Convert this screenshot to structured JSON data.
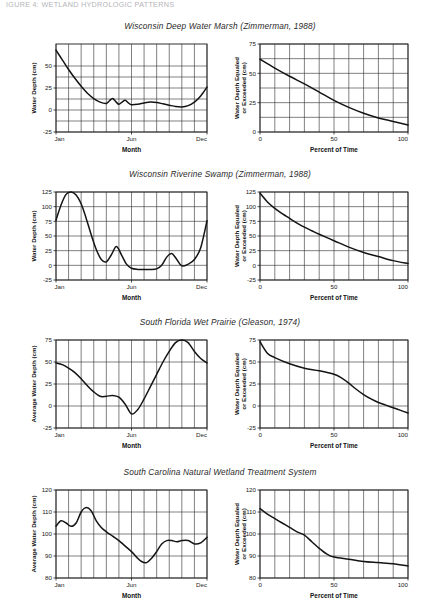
{
  "page": {
    "header_text": "IGURE 4: WETLAND HYDROLOGIC PATTERNS"
  },
  "rows": [
    {
      "title": "Wisconsin Deep Water Marsh (Zimmerman, 1988)",
      "left": {
        "ylabel": "Water Depth (cm)",
        "xlabel": "Month",
        "yticks": [
          "-25",
          "0",
          "25",
          "50"
        ],
        "xticks": [
          "Jan",
          "Jun",
          "Dec"
        ]
      },
      "right": {
        "ylabel_line1": "Water Depth Equaled",
        "ylabel_line2": "or Exceeded (cm)",
        "xlabel": "Percent of Time",
        "yticks": [
          "0",
          "25",
          "50",
          "75"
        ],
        "xticks": [
          "0",
          "50",
          "100"
        ]
      }
    },
    {
      "title": "Wisconsin Riverine Swamp (Zimmerman, 1988)",
      "left": {
        "ylabel": "Water Depth (cm)",
        "xlabel": "Month",
        "yticks": [
          "-25",
          "0",
          "25",
          "50",
          "75",
          "100",
          "125"
        ],
        "xticks": [
          "Jan",
          "Jun",
          "Dec"
        ]
      },
      "right": {
        "ylabel_line1": "Water Depth Equaled",
        "ylabel_line2": "or Exceeded (cm)",
        "xlabel": "Percent of Time",
        "yticks": [
          "-25",
          "0",
          "25",
          "50",
          "75",
          "100",
          "125"
        ],
        "xticks": [
          "0",
          "50",
          "100"
        ]
      }
    },
    {
      "title": "South Florida Wet Prairie (Gleason, 1974)",
      "left": {
        "ylabel": "Average Water Depth (cm)",
        "xlabel": "Month",
        "yticks": [
          "-25",
          "0",
          "25",
          "50",
          "75"
        ],
        "xticks": [
          "Jan",
          "Jun",
          "Dec"
        ]
      },
      "right": {
        "ylabel_line1": "Water Depth Equaled",
        "ylabel_line2": "or Exceeded (cm)",
        "xlabel": "Percent of Time",
        "yticks": [
          "-25",
          "0",
          "25",
          "50",
          "75"
        ],
        "xticks": [
          "0",
          "50",
          "100"
        ]
      }
    },
    {
      "title": "South Carolina Natural Wetland Treatment System",
      "left": {
        "ylabel": "Average Water Depth (cm)",
        "xlabel": "Month",
        "yticks": [
          "80",
          "90",
          "100",
          "110",
          "120"
        ],
        "xticks": [
          "Jan",
          "Jun",
          "Dec"
        ]
      },
      "right": {
        "ylabel_line1": "Water Depth Equaled",
        "ylabel_line2": "or Exceeded (cm)",
        "xlabel": "Percent of Time",
        "yticks": [
          "80",
          "90",
          "100",
          "110",
          "120"
        ],
        "xticks": [
          "0",
          "50",
          "100"
        ]
      }
    }
  ],
  "chart_data": [
    {
      "type": "line",
      "title": "Wisconsin Deep Water Marsh (Zimmerman, 1988) - Hydrograph",
      "xlabel": "Month",
      "ylabel": "Water Depth (cm)",
      "xlim": [
        0,
        12
      ],
      "ylim": [
        -25,
        75
      ],
      "ytick_values": [
        -25,
        0,
        25,
        50
      ],
      "xtick_values": [
        0,
        6,
        12
      ],
      "xtick_labels": [
        "Jan",
        "Jun",
        "Dec"
      ],
      "grid": true,
      "x": [
        0,
        0.5,
        1,
        1.5,
        2,
        2.5,
        3,
        3.5,
        4,
        4.25,
        4.5,
        4.75,
        5,
        5.25,
        5.5,
        5.75,
        6,
        6.5,
        7,
        7.5,
        8,
        8.5,
        9,
        9.5,
        10,
        10.5,
        11,
        11.5,
        12
      ],
      "y": [
        68,
        57,
        46,
        36,
        27,
        19,
        13,
        9,
        7.5,
        10.5,
        13,
        9.5,
        6.5,
        9,
        11,
        8,
        6,
        6.5,
        8,
        9,
        8.5,
        7,
        5.5,
        4,
        3.5,
        5,
        9,
        16,
        26
      ]
    },
    {
      "type": "line",
      "title": "Wisconsin Deep Water Marsh (Zimmerman, 1988) - Duration Curve",
      "xlabel": "Percent of Time",
      "ylabel": "Water Depth Equaled or Exceeded (cm)",
      "xlim": [
        0,
        100
      ],
      "ylim": [
        0,
        75
      ],
      "ytick_values": [
        0,
        25,
        50,
        75
      ],
      "xtick_values": [
        0,
        50,
        100
      ],
      "grid": true,
      "x": [
        0,
        10,
        20,
        30,
        40,
        50,
        60,
        70,
        80,
        90,
        100
      ],
      "y": [
        62,
        54.5,
        47.5,
        41,
        34,
        27,
        21,
        16,
        12,
        9,
        6
      ]
    },
    {
      "type": "line",
      "title": "Wisconsin Riverine Swamp (Zimmerman, 1988) - Hydrograph",
      "xlabel": "Month",
      "ylabel": "Water Depth (cm)",
      "xlim": [
        0,
        12
      ],
      "ylim": [
        -25,
        125
      ],
      "ytick_values": [
        -25,
        0,
        25,
        50,
        75,
        100,
        125
      ],
      "xtick_values": [
        0,
        6,
        12
      ],
      "xtick_labels": [
        "Jan",
        "Jun",
        "Dec"
      ],
      "grid": true,
      "x": [
        0,
        0.4,
        0.8,
        1.2,
        1.6,
        2,
        2.4,
        2.8,
        3.2,
        3.6,
        4,
        4.4,
        4.8,
        5.2,
        5.6,
        6,
        6.5,
        7,
        7.5,
        8,
        8.4,
        8.8,
        9.2,
        9.6,
        10,
        10.5,
        11,
        11.5,
        12
      ],
      "y": [
        77,
        103,
        121,
        125,
        120,
        105,
        80,
        52,
        27,
        10,
        6,
        18,
        32,
        18,
        2,
        -5,
        -7,
        -7,
        -7,
        -6,
        0,
        14,
        20,
        10,
        -1,
        2,
        10,
        30,
        76
      ]
    },
    {
      "type": "line",
      "title": "Wisconsin Riverine Swamp (Zimmerman, 1988) - Duration Curve",
      "xlabel": "Percent of Time",
      "ylabel": "Water Depth Equaled or Exceeded (cm)",
      "xlim": [
        0,
        100
      ],
      "ylim": [
        -25,
        125
      ],
      "ytick_values": [
        -25,
        0,
        25,
        50,
        75,
        100,
        125
      ],
      "xtick_values": [
        0,
        50,
        100
      ],
      "grid": true,
      "x": [
        0,
        5,
        10,
        15,
        20,
        25,
        30,
        35,
        40,
        50,
        60,
        70,
        80,
        90,
        100
      ],
      "y": [
        123,
        108,
        97,
        88,
        80,
        72,
        65,
        59,
        53,
        42,
        31,
        22,
        15,
        8,
        3
      ]
    },
    {
      "type": "line",
      "title": "South Florida Wet Prairie (Gleason, 1974) - Hydrograph",
      "xlabel": "Month",
      "ylabel": "Average Water Depth (cm)",
      "xlim": [
        0,
        12
      ],
      "ylim": [
        -25,
        75
      ],
      "ytick_values": [
        -25,
        0,
        25,
        50,
        75
      ],
      "xtick_values": [
        0,
        6,
        12
      ],
      "xtick_labels": [
        "Jan",
        "Jun",
        "Dec"
      ],
      "grid": true,
      "x": [
        0,
        0.5,
        1,
        1.5,
        2,
        2.5,
        3,
        3.5,
        4,
        4.5,
        5,
        5.5,
        6,
        6.5,
        7,
        7.5,
        8,
        8.5,
        9,
        9.5,
        10,
        10.5,
        11,
        11.5,
        12
      ],
      "y": [
        49,
        47,
        43,
        38,
        31,
        23,
        16,
        11,
        11,
        12,
        10,
        2,
        -9,
        -4,
        8,
        22,
        36,
        50,
        62,
        72,
        76,
        72,
        62,
        54,
        49
      ]
    },
    {
      "type": "line",
      "title": "South Florida Wet Prairie (Gleason, 1974) - Duration Curve",
      "xlabel": "Percent of Time",
      "ylabel": "Water Depth Equaled or Exceeded (cm)",
      "xlim": [
        0,
        100
      ],
      "ylim": [
        -25,
        75
      ],
      "ytick_values": [
        -25,
        0,
        25,
        50,
        75
      ],
      "xtick_values": [
        0,
        50,
        100
      ],
      "grid": true,
      "x": [
        0,
        5,
        10,
        20,
        30,
        40,
        50,
        55,
        60,
        65,
        70,
        75,
        80,
        85,
        90,
        95,
        100
      ],
      "y": [
        73,
        60,
        55,
        48,
        43,
        40,
        36,
        32,
        26,
        19,
        13,
        8,
        4,
        1,
        -2,
        -5,
        -8
      ]
    },
    {
      "type": "line",
      "title": "South Carolina Natural Wetland Treatment System - Hydrograph",
      "xlabel": "Month",
      "ylabel": "Average Water Depth (cm)",
      "xlim": [
        0,
        12
      ],
      "ylim": [
        80,
        120
      ],
      "ytick_values": [
        80,
        90,
        100,
        110,
        120
      ],
      "xtick_values": [
        0,
        6,
        12
      ],
      "xtick_labels": [
        "Jan",
        "Jun",
        "Dec"
      ],
      "grid": true,
      "x": [
        0,
        0.4,
        0.8,
        1.2,
        1.6,
        2,
        2.4,
        2.8,
        3.2,
        3.6,
        4,
        4.5,
        5,
        5.5,
        6,
        6.4,
        6.8,
        7.2,
        7.6,
        8,
        8.4,
        8.8,
        9.2,
        9.6,
        10,
        10.5,
        11,
        11.5,
        12
      ],
      "y": [
        103.5,
        106,
        105,
        103.5,
        105,
        110,
        112,
        110.5,
        106,
        103,
        101,
        99,
        97,
        94.5,
        92,
        89.5,
        87.5,
        87,
        89,
        92,
        95.5,
        97,
        97,
        96.5,
        97,
        97,
        95.5,
        96,
        98.5
      ]
    },
    {
      "type": "line",
      "title": "South Carolina Natural Wetland Treatment System - Duration Curve",
      "xlabel": "Percent of Time",
      "ylabel": "Water Depth Equaled or Exceeded (cm)",
      "xlim": [
        0,
        100
      ],
      "ylim": [
        80,
        120
      ],
      "ytick_values": [
        80,
        90,
        100,
        110,
        120
      ],
      "xtick_values": [
        0,
        50,
        100
      ],
      "grid": true,
      "x": [
        0,
        5,
        10,
        15,
        20,
        25,
        30,
        35,
        40,
        45,
        50,
        60,
        70,
        80,
        90,
        100
      ],
      "y": [
        111.5,
        109,
        107,
        105,
        103,
        101,
        99.5,
        96.5,
        93.5,
        91,
        89.5,
        88.5,
        87.5,
        87,
        86.5,
        85.5
      ]
    }
  ]
}
